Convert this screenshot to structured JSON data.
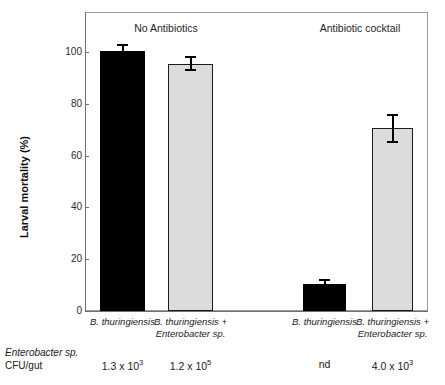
{
  "chart_data": {
    "type": "bar",
    "title": "",
    "xlabel": "",
    "ylabel": "Larval mortality (%)",
    "ylim": [
      0,
      105
    ],
    "yticks": [
      0,
      20,
      40,
      60,
      80,
      100
    ],
    "ytick_labels": [
      "0",
      "20",
      "40",
      "60",
      "80",
      "100"
    ],
    "grid": false,
    "legend": "none",
    "group_headers": [
      "No Antibiotics",
      "Antibiotic cocktail"
    ],
    "categories": [
      {
        "line1": "B. thuringiensis",
        "line2": ""
      },
      {
        "line1": "B. thuringiensis +",
        "line2": "Enterobacter sp."
      },
      {
        "line1": "B. thuringiensis",
        "line2": ""
      },
      {
        "line1": "B. thuringiensis +",
        "line2": "Enterobacter sp."
      }
    ],
    "values": [
      100.5,
      95.5,
      10.5,
      70.5
    ],
    "errors": [
      2.5,
      3.0,
      2.0,
      5.5
    ],
    "bar_colors": [
      "#000000",
      "#dcdcdc",
      "#000000",
      "#dcdcdc"
    ],
    "annotation_row": {
      "label_line1": "Enterobacter sp.",
      "label_line2": "CFU/gut",
      "values": [
        {
          "mantissa": "1.3 x 10",
          "exponent": "3"
        },
        {
          "mantissa": "1.2 x 10",
          "exponent": "5"
        },
        {
          "mantissa": "nd",
          "exponent": ""
        },
        {
          "mantissa": "4.0 x 10",
          "exponent": "3"
        }
      ]
    }
  }
}
